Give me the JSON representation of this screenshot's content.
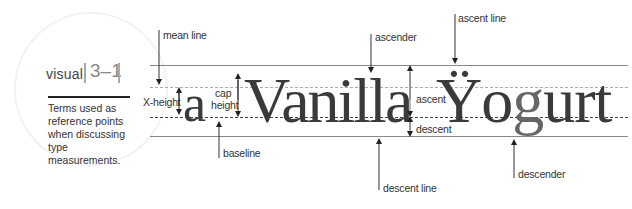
{
  "sidebar": {
    "visual_label": "visual",
    "figure_number": "3–1",
    "caption": "Terms used as reference points when discussing type measurements."
  },
  "specimen": {
    "letter_a": "a",
    "word_1": "Vanilla",
    "word_2_first": "Ÿ",
    "word_2_rest_1": "o",
    "word_2_g": "g",
    "word_2_rest_2": "urt",
    "descender_color": "#777777"
  },
  "labels": {
    "mean_line": "mean line",
    "x_height": "X-height",
    "cap_height_line1": "cap",
    "cap_height_line2": "height",
    "baseline": "baseline",
    "ascender": "ascender",
    "ascent": "ascent",
    "descent": "descent",
    "descent_line": "descent line",
    "ascent_line": "ascent line",
    "descender": "descender"
  }
}
